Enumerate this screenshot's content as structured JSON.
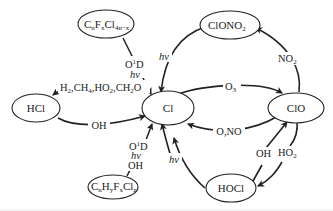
{
  "diagram": {
    "type": "chemical-reaction-cycle",
    "nodes": {
      "cl": "Cl",
      "clo": "ClO",
      "clono2": "ClONO",
      "clono2_sub": "2",
      "hcl": "HCl",
      "hocl": "HOCl",
      "cfc_c": "C",
      "cfc_n": "n",
      "cfc_f": "F",
      "cfc_x": "x",
      "cfc_cl": "Cl",
      "cfc_sub": "4n−x",
      "hcfc_c": "C",
      "hcfc_n": "n",
      "hcfc_h": "H",
      "hcfc_y": "y",
      "hcfc_f": "F",
      "hcfc_x": "x",
      "hcfc_cl": "Cl",
      "hcfc_z": "z"
    },
    "edges": {
      "cfc_to_cl_o1d": "O",
      "cfc_to_cl_o1d_sup": "1",
      "cfc_to_cl_o1d_d": "D",
      "cfc_to_cl_hv": "hv",
      "clono2_to_cl_hv": "hv",
      "hcl_from_cl_part1": "H",
      "hcl_from_cl_sub1": "2",
      "hcl_from_cl_part2": ",CH",
      "hcl_from_cl_sub2": "4",
      "hcl_from_cl_part3": ",HO",
      "hcl_from_cl_sub3": "2",
      "hcl_from_cl_part4": ",CH",
      "hcl_from_cl_sub4": "2",
      "hcl_from_cl_part5": "O",
      "hcl_to_cl": "OH",
      "cl_to_clo": "O",
      "cl_to_clo_sub": "3",
      "clo_to_cl": "O,NO",
      "clo_to_clono2": "NO",
      "clo_to_clono2_sub": "2",
      "hcfc_to_cl_o1d": "O",
      "hcfc_to_cl_o1d_sup": "1",
      "hcfc_to_cl_o1d_d": "D",
      "hcfc_to_cl_hv": "hv",
      "hcfc_to_cl_oh": "OH",
      "hocl_to_cl_hv": "hv",
      "hocl_to_clo": "OH",
      "clo_to_hocl": "HO",
      "clo_to_hocl_sub": "2"
    }
  }
}
